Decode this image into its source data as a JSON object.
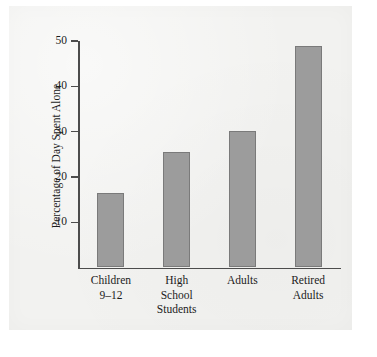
{
  "chart_data": {
    "type": "bar",
    "title": "",
    "subtitle": "",
    "xlabel": "",
    "ylabel": "Percentage of Day Spent Alone",
    "categories": [
      "Children 9–12",
      "High School Students",
      "Adults",
      "Retired Adults"
    ],
    "category_lines": [
      [
        "Children",
        "9–12"
      ],
      [
        "High",
        "School",
        "Students"
      ],
      [
        "Adults"
      ],
      [
        "Retired",
        "Adults"
      ]
    ],
    "values": [
      16.5,
      25.5,
      30.2,
      49
    ],
    "ylim": [
      0,
      52
    ],
    "yticks": [
      10,
      20,
      30,
      40,
      50
    ],
    "ytick_labels": [
      "10",
      "20",
      "30",
      "40",
      "50"
    ],
    "grid": false,
    "legend": false,
    "legend_position": "none",
    "bar_color": "#9c9c9c",
    "bar_edge_color": "#7a7a7a",
    "axis_color": "#4c4c4c",
    "text_color": "#1c1c1c",
    "panel_background": "#f2f2f0",
    "page_background": "#ffffff"
  }
}
